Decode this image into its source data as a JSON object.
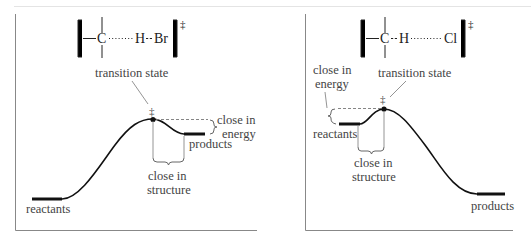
{
  "diagrams": [
    {
      "id": "exothermic",
      "ts_structure": {
        "atom1": "C",
        "atom2": "H",
        "atom3": "Br",
        "bond_C_H": "long-dotted",
        "bond_H_X": "short-dashed",
        "superscript": "‡"
      },
      "labels": {
        "transition_state": "transition state",
        "ts_mark": "‡",
        "energy_1": "close in",
        "energy_2": "energy",
        "structure_1": "close in",
        "structure_2": "structure",
        "products": "products",
        "reactants": "reactants"
      }
    },
    {
      "id": "endothermic",
      "ts_structure": {
        "atom1": "C",
        "atom2": "H",
        "atom3": "Cl",
        "bond_C_H": "short-dashed",
        "bond_H_X": "long-dotted",
        "superscript": "‡"
      },
      "labels": {
        "transition_state": "transition state",
        "ts_mark": "‡",
        "energy_1": "close in",
        "energy_2": "energy",
        "structure_1": "close in",
        "structure_2": "structure",
        "products": "products",
        "reactants": "reactants"
      }
    }
  ]
}
